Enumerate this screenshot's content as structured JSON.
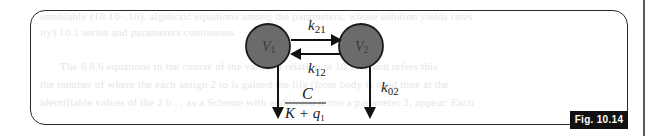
{
  "figure": {
    "label": "Fig. 10.14",
    "compartments": [
      {
        "id": "V1",
        "label": "V",
        "subscript": "1",
        "fill": "#6b6b6b"
      },
      {
        "id": "V2",
        "label": "V",
        "subscript": "2",
        "fill": "#6b6b6b"
      }
    ],
    "rates": {
      "k21": {
        "base": "k",
        "sub": "21",
        "from": "V1",
        "to": "V2"
      },
      "k12": {
        "base": "k",
        "sub": "12",
        "from": "V2",
        "to": "V1"
      },
      "k02": {
        "base": "k",
        "sub": "02",
        "from": "V2",
        "to": "out"
      },
      "elimination_v1": {
        "numerator": "C",
        "denominator_base": "K + q",
        "denominator_sub": "1",
        "from": "V1",
        "to": "out"
      }
    }
  },
  "background": {
    "ghost_lines": [
      "semblably (10.10–.16). algebraic equations among the parameters, whose solution yields rates",
      "ity) 10.1 series and parameters continuous",
      "The 6.6.6 equations in the course of the values a relation in 10.10.1 and refers this",
      "the number of where the each assign 2 to is gained the life (from body is used time at the",
      "identifiable values of the 2 b . ; as a Scheme with additional terms a parameter 2, appear. Each"
    ]
  }
}
